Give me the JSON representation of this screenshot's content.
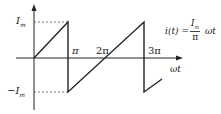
{
  "diagram": {
    "type": "sawtooth waveform",
    "y_labels": {
      "top": "I",
      "top_sub": "m",
      "bottom": "−I",
      "bottom_sub": "m"
    },
    "x_labels": {
      "pi": "π",
      "two_pi": "2π",
      "three_pi": "3π",
      "axis": "ωt"
    },
    "formula": {
      "lhs": "i(t) =",
      "numerator": "I",
      "numerator_sub": "m",
      "denominator": "π",
      "rhs": "ωt"
    },
    "colors": {
      "line": "#222222",
      "dashed": "#555555"
    }
  }
}
